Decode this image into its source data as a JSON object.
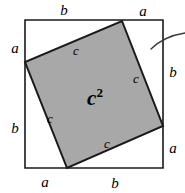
{
  "figure": {
    "canvas": {
      "width": 185,
      "height": 193
    },
    "colors": {
      "background": "#ffffff",
      "inner_square_fill": "#a8a8a8",
      "stroke": "#1a1a1a",
      "text": "#000000"
    },
    "outer_square": {
      "name": "outer-square",
      "points": "25,20 163,20 163,168 25,168",
      "stroke_width": 1.6,
      "fill": "none"
    },
    "inner_square": {
      "name": "inner-square",
      "points": "122,21 163,126 67,168 25,62",
      "stroke_width": 2.0
    },
    "arc": {
      "name": "pointer-arc",
      "path": "M 151,49 C 160,40 172,35 185,33",
      "stroke_width": 1.4
    },
    "labels": {
      "outer": [
        {
          "name": "label-top-b",
          "text": "b",
          "x": 64,
          "y": 10
        },
        {
          "name": "label-top-a",
          "text": "a",
          "x": 143,
          "y": 11
        },
        {
          "name": "label-left-a",
          "text": "a",
          "x": 15,
          "y": 48
        },
        {
          "name": "label-left-b",
          "text": "b",
          "x": 15,
          "y": 128
        },
        {
          "name": "label-right-b",
          "text": "b",
          "x": 173,
          "y": 72
        },
        {
          "name": "label-right-a",
          "text": "a",
          "x": 173,
          "y": 148
        },
        {
          "name": "label-bottom-a",
          "text": "a",
          "x": 45,
          "y": 182
        },
        {
          "name": "label-bottom-b",
          "text": "b",
          "x": 115,
          "y": 183
        }
      ],
      "inner": [
        {
          "name": "label-side-c-top",
          "text": "c",
          "x": 76,
          "y": 50
        },
        {
          "name": "label-side-c-right",
          "text": "c",
          "x": 136,
          "y": 78
        },
        {
          "name": "label-side-c-left",
          "text": "c",
          "x": 50,
          "y": 118
        },
        {
          "name": "label-side-c-bottom",
          "text": "c",
          "x": 107,
          "y": 143
        }
      ],
      "area": {
        "name": "label-area-c-squared",
        "base": "c",
        "exponent": "2",
        "x": 95,
        "y": 98
      }
    }
  }
}
